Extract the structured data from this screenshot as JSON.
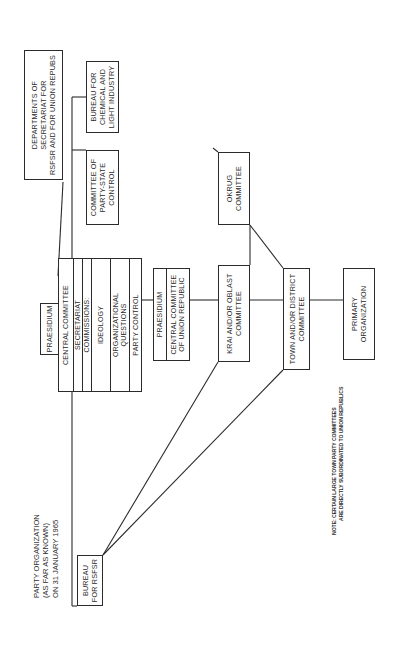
{
  "title": {
    "lines": [
      "PARTY ORGANIZATION",
      "(AS FAR AS KNOWN)",
      "ON 31 JANUARY 1965"
    ]
  },
  "central_committee_block": {
    "praesidium": "PRAESIDIUM",
    "central_committee": "CENTRAL COMMITTEE",
    "secretariat": "SECRETARIAT",
    "commissions_header": "COMMISSIONS:",
    "commissions": [
      {
        "lines": [
          "IDEOLOGY"
        ]
      },
      {
        "lines": [
          "ORGANIZATIONAL",
          "QUESTIONS"
        ]
      },
      {
        "lines": [
          "PARTY CONTROL"
        ]
      }
    ]
  },
  "departments_secretariat": {
    "lines": [
      "DEPARTMENTS OF",
      "SECRETARIAT FOR",
      "RSFSR AND FOR UNION REPUBS"
    ]
  },
  "bureau_chemical_light": {
    "lines": [
      "BUREAU  FOR",
      "CHEMICAL AND",
      "LIGHT INDUSTRY"
    ]
  },
  "committee_party_state": {
    "lines": [
      "COMMITTEE OF",
      "PARTY-STATE",
      "CONTROL"
    ]
  },
  "bureau_rsfsr": {
    "lines": [
      "BUREAU",
      "FOR RSFSR"
    ]
  },
  "union_republic_block": {
    "praesidium": "PRAESIDIUM",
    "central_committee": [
      "CENTRAL COMMITTEE",
      "OF UNION REPUBLIC"
    ]
  },
  "krai_oblast": {
    "lines": [
      "KRAI AND/OR OBLAST",
      "COMMITTEE"
    ]
  },
  "okrug": {
    "lines": [
      "OKRUG",
      "COMMITTEE"
    ]
  },
  "town_district": {
    "lines": [
      "TOWN AND/OR DISTRICT",
      "COMMITTEE"
    ]
  },
  "primary_org": {
    "lines": [
      "PRIMARY",
      "ORGANIZATION"
    ]
  },
  "note": {
    "lines": [
      "NOTE: CERTAIN LARGE TOWN PARTY COMMITTEES",
      "ARE DIRECTLY SUBORDINATED TO UNION REPUBLICS"
    ]
  },
  "colors": {
    "line": "#2b2b2b",
    "text": "#2a2a2a",
    "background": "#ffffff"
  }
}
